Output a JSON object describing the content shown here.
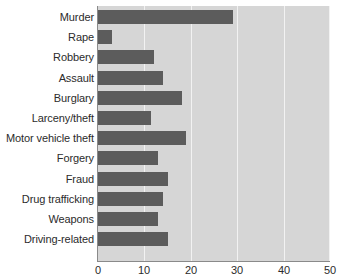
{
  "chart_data": {
    "type": "bar",
    "orientation": "horizontal",
    "title": "",
    "xlabel": "",
    "ylabel": "",
    "xlim": [
      0,
      50
    ],
    "xticks": [
      0,
      10,
      20,
      30,
      40,
      50
    ],
    "grid": true,
    "legend": false,
    "bar_color": "#5c5c5c",
    "plot_background": "#d6d6d6",
    "gridline_color": "#f2f2f2",
    "axis_color": "#8a8a8a",
    "label_color": "#2b2b2b",
    "categories": [
      "Murder",
      "Rape",
      "Robbery",
      "Assault",
      "Burglary",
      "Larceny/theft",
      "Motor vehicle theft",
      "Forgery",
      "Fraud",
      "Drug trafficking",
      "Weapons",
      "Driving-related"
    ],
    "values": [
      29,
      3,
      12,
      14,
      18,
      11.5,
      19,
      13,
      15,
      14,
      13,
      15
    ]
  }
}
